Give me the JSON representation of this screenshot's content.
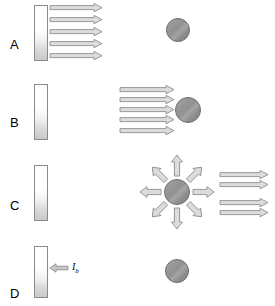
{
  "figure": {
    "title": "",
    "background_color": "#ffffff",
    "stroke_color": "#8a8a8a",
    "arrow_fill": "#d9d9d9",
    "sphere_color": "#919191",
    "slab_top_color": "#ffffff",
    "slab_bottom_color": "#c9c9c9",
    "label_color": "#000000"
  },
  "panels": [
    {
      "label": "A",
      "label_x": 10,
      "label_y": 44,
      "slab": {
        "x": 34,
        "y": 5,
        "w": 14,
        "h": 56
      },
      "sphere": {
        "cx": 178,
        "cy": 30,
        "r": 12
      },
      "rays_from_slab": {
        "count": 5,
        "direction": "right",
        "x_start": 50,
        "length": 52,
        "ys": [
          8,
          20,
          32,
          44,
          56
        ]
      },
      "rays_to_sphere": {
        "count": 0
      },
      "radial_rays": {
        "count": 0
      },
      "rays_right_of_sphere": {
        "count": 0
      },
      "incident_label": ""
    },
    {
      "label": "B",
      "label_x": 10,
      "label_y": 122,
      "slab": {
        "x": 34,
        "y": 84,
        "w": 14,
        "h": 56
      },
      "sphere": {
        "cx": 188,
        "cy": 110,
        "r": 13
      },
      "rays_from_slab": {
        "count": 0
      },
      "rays_to_sphere": {
        "count": 5,
        "direction": "right",
        "x_start": 120,
        "length": 54,
        "ys": [
          89,
          99,
          109,
          119,
          130
        ]
      },
      "radial_rays": {
        "count": 0
      },
      "rays_right_of_sphere": {
        "count": 0
      },
      "incident_label": ""
    },
    {
      "label": "C",
      "label_x": 10,
      "label_y": 205,
      "slab": {
        "x": 34,
        "y": 165,
        "w": 14,
        "h": 56
      },
      "sphere": {
        "cx": 177,
        "cy": 192,
        "r": 13
      },
      "rays_from_slab": {
        "count": 0
      },
      "rays_to_sphere": {
        "count": 0
      },
      "radial_rays": {
        "count": 8,
        "directions": [
          "up",
          "up-right",
          "right",
          "down-right",
          "down",
          "down-left",
          "left",
          "up-left"
        ],
        "inner_radius": 16,
        "outer_radius": 34
      },
      "rays_right_of_sphere": {
        "count": 4,
        "direction": "right",
        "x_start": 220,
        "length": 48,
        "ys": [
          174,
          184,
          202,
          212
        ]
      },
      "incident_label": ""
    },
    {
      "label": "D",
      "label_x": 10,
      "label_y": 293,
      "slab": {
        "x": 34,
        "y": 246,
        "w": 14,
        "h": 52
      },
      "sphere": {
        "cx": 177,
        "cy": 271,
        "r": 12
      },
      "rays_from_slab": {
        "count": 0
      },
      "rays_to_sphere": {
        "count": 0
      },
      "radial_rays": {
        "count": 0
      },
      "rays_right_of_sphere": {
        "count": 0
      },
      "incident_arrow": {
        "direction": "left",
        "x_start": 50,
        "length": 16,
        "y": 268
      },
      "incident_label": "I",
      "incident_label_sub": "b",
      "incident_label_x": 72,
      "incident_label_y": 264
    }
  ]
}
